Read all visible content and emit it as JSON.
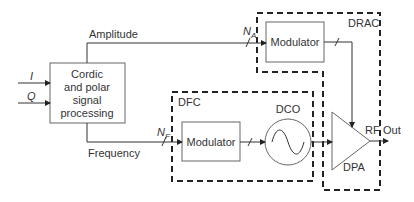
{
  "blocks": {
    "cordic": {
      "lines": [
        "Cordic",
        "and polar",
        "signal",
        "processing"
      ]
    },
    "modulator_amp": {
      "label": "Modulator"
    },
    "modulator_freq": {
      "label": "Modulator"
    },
    "dco": {
      "label": "DCO"
    },
    "dpa": {
      "label": "DPA"
    }
  },
  "groups": {
    "drac": {
      "label": "DRAC"
    },
    "dfc": {
      "label": "DFC"
    }
  },
  "signals": {
    "i_input": "I",
    "q_input": "Q",
    "amplitude": "Amplitude",
    "frequency": "Frequency",
    "na_main": "N",
    "na_sub": "A",
    "nf_main": "N",
    "nf_sub": "F",
    "rf": "RF",
    "out": "Out"
  },
  "colors": {
    "line": "#333333",
    "box_border": "#555555",
    "dashed": "#222222"
  }
}
